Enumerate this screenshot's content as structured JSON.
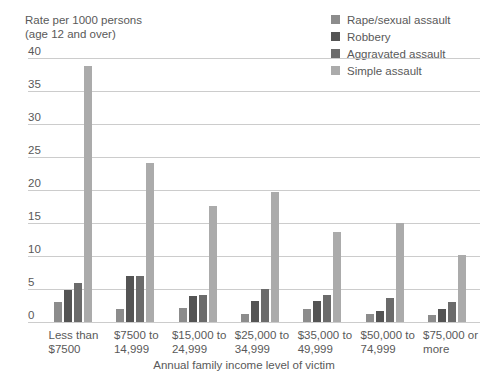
{
  "chart_data": {
    "type": "bar",
    "title": "Rate per 1000 persons (age 12 and over)",
    "title_lines": [
      "Rate per 1000 persons",
      "(age 12 and over)"
    ],
    "xlabel": "Annual family income level of victim",
    "ylabel": "Rate per 1000 persons (age 12 and over)",
    "ylim": [
      0,
      40
    ],
    "ytick_interval": 5,
    "yticks": [
      40,
      35,
      30,
      25,
      20,
      15,
      10,
      5,
      0
    ],
    "grid": true,
    "legend_position": "top-right",
    "background_color": "#ffffff",
    "gridline_color": "#cccccc",
    "text_color": "#595959",
    "categories": [
      "Less than $7500",
      "$7500 to 14,999",
      "$15,000 to 24,999",
      "$25,000 to 34,999",
      "$35,000 to 49,999",
      "$50,000 to 74,999",
      "$75,000 or more"
    ],
    "category_label_lines": [
      [
        "Less than",
        "$7500"
      ],
      [
        "$7500 to",
        "14,999"
      ],
      [
        "$15,000 to",
        "24,999"
      ],
      [
        "$25,000 to",
        "34,999"
      ],
      [
        "$35,000 to",
        "49,999"
      ],
      [
        "$50,000 to",
        "74,999"
      ],
      [
        "$75,000 or",
        "more"
      ]
    ],
    "series": [
      {
        "name": "Rape/sexual assault",
        "color": "#8c8c8c",
        "values": [
          3.0,
          2.0,
          2.1,
          1.2,
          2.0,
          1.2,
          1.0
        ]
      },
      {
        "name": "Robbery",
        "color": "#545454",
        "values": [
          4.8,
          7.0,
          3.9,
          3.2,
          3.2,
          1.7,
          2.0
        ]
      },
      {
        "name": "Aggravated assault",
        "color": "#6b6b6b",
        "values": [
          5.9,
          6.9,
          4.1,
          5.0,
          4.1,
          3.7,
          3.0
        ]
      },
      {
        "name": "Simple assault",
        "color": "#ababab",
        "values": [
          38.8,
          24.1,
          17.6,
          19.7,
          13.7,
          15.0,
          10.2
        ]
      }
    ]
  }
}
